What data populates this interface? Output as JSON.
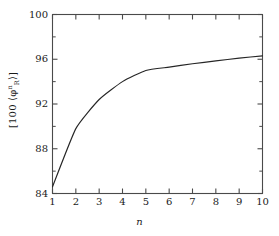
{
  "chart_data": {
    "type": "line",
    "title": "",
    "subtitle": "",
    "xlabel": "n",
    "ylabel_text": "[100 ⟨φ",
    "ylabel_sup": "n",
    "ylabel_sub": "R",
    "ylabel_tail": "⟩]",
    "ylabel_full": "[100 ⟨φⁿᵣ⟩]",
    "x": [
      1,
      2,
      3,
      4,
      5,
      6,
      7,
      8,
      9,
      10
    ],
    "values": [
      84.6,
      89.8,
      92.4,
      94.0,
      95.0,
      95.3,
      95.6,
      95.85,
      96.1,
      96.3
    ],
    "series": [
      {
        "name": "phi_R",
        "values": [
          84.6,
          89.8,
          92.4,
          94.0,
          95.0,
          95.3,
          95.6,
          95.85,
          96.1,
          96.3
        ]
      }
    ],
    "xlim": [
      1,
      10
    ],
    "ylim": [
      84,
      100
    ],
    "x_major_ticks": [
      1,
      2,
      3,
      4,
      5,
      6,
      7,
      8,
      9,
      10
    ],
    "x_tick_labels": [
      "1",
      "2",
      "3",
      "4",
      "5",
      "6",
      "7",
      "8",
      "9",
      "10"
    ],
    "y_major_ticks": [
      84,
      88,
      92,
      96,
      100
    ],
    "y_tick_labels": [
      "84",
      "88",
      "92",
      "96",
      "100"
    ],
    "y_minor_ticks": [
      86,
      90,
      94,
      98
    ],
    "grid": false,
    "legend": false,
    "legend_position": "none",
    "line_color": "#262626",
    "axis_color": "#4a4a4a",
    "background_color": "#ffffff"
  }
}
